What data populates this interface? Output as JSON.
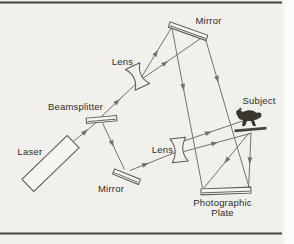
{
  "diagram": {
    "type": "optical-setup",
    "labels": {
      "laser": "Laser",
      "beamsplitter": "Beamsplitter",
      "lens_top": "Lens",
      "mirror_top": "Mirror",
      "mirror_bottom": "Mirror",
      "lens_bottom": "Lens",
      "subject": "Subject",
      "photographic_plate_line1": "Photographic",
      "photographic_plate_line2": "Plate"
    },
    "icons": {
      "subject_figure": "horse-silhouette",
      "lens_glyph": "concave-lens-bowtie",
      "mirror_glyph": "tilted-slab",
      "beamsplitter_glyph": "tilted-slab"
    }
  },
  "colors": {
    "panel_bg": "#f1f0ed",
    "page_bg": "#fbfbf9",
    "rule": "#44423d",
    "beam_line": "#75726b",
    "component_outline": "#5a5851",
    "component_fill": "#f6f5f2",
    "subject_fill": "#38362f",
    "label_text": "#2e2d29"
  }
}
